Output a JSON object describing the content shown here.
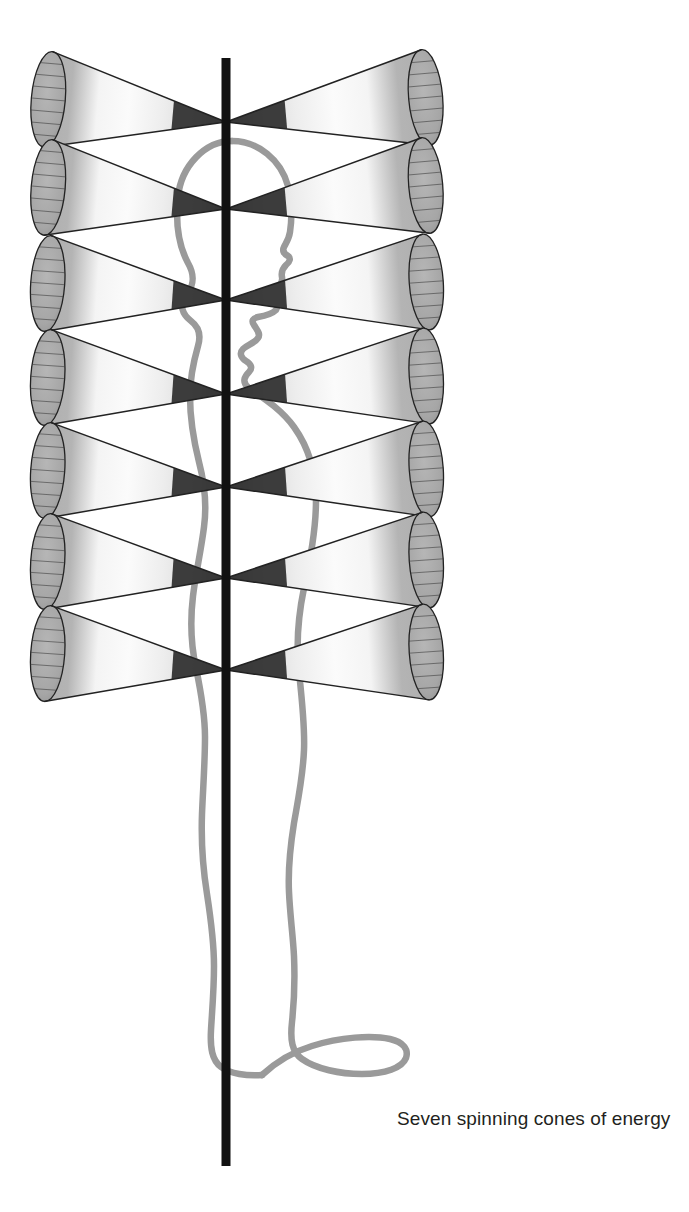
{
  "figure": {
    "title": "Seven spinning cones of energy",
    "background_color": "#ffffff",
    "caption": {
      "text": "Seven spinning cones of energy",
      "color": "#231f20",
      "x": 397,
      "y": 1106,
      "font_size_px": 19
    },
    "axis": {
      "name": "central-vertical-axis",
      "color": "#111111",
      "x": 226,
      "top": 58,
      "bottom": 1166,
      "width": 9
    },
    "body_outline": {
      "name": "human-figure-profile",
      "color": "#9a9a9a",
      "stroke_width": 6,
      "facing": "right",
      "top": 140,
      "bottom": 1082
    },
    "cone_style": {
      "base_fill": "#a9a9a9",
      "mid_fill": "#f2f2f2",
      "mesh_color": "#3a3a3a",
      "outline_color": "#222222",
      "apex_fill": "#2e2e2e",
      "meridian_count": 16,
      "ring_count": 4
    },
    "cones": {
      "count": 14,
      "pairs": 7,
      "apex_x": 226,
      "left_base_x": 47,
      "right_base_x": 427,
      "base_radius_y": 48,
      "base_radius_x": 17,
      "rows": [
        {
          "index": 1,
          "name": "crown-cone-pair",
          "apex_y": 122,
          "base_cy": 115,
          "tilt_deg": 5
        },
        {
          "index": 2,
          "name": "third-eye-cone-pair",
          "apex_y": 209,
          "base_cy": 203,
          "tilt_deg": 5
        },
        {
          "index": 3,
          "name": "throat-cone-pair",
          "apex_y": 300,
          "base_cy": 296,
          "tilt_deg": 4
        },
        {
          "index": 4,
          "name": "heart-cone-pair",
          "apex_y": 394,
          "base_cy": 390,
          "tilt_deg": 4
        },
        {
          "index": 5,
          "name": "solar-plexus-cone-pair",
          "apex_y": 487,
          "base_cy": 483,
          "tilt_deg": 4
        },
        {
          "index": 6,
          "name": "sacral-cone-pair",
          "apex_y": 578,
          "base_cy": 574,
          "tilt_deg": 4
        },
        {
          "index": 7,
          "name": "root-cone-pair",
          "apex_y": 670,
          "base_cy": 666,
          "tilt_deg": 4
        }
      ]
    }
  }
}
